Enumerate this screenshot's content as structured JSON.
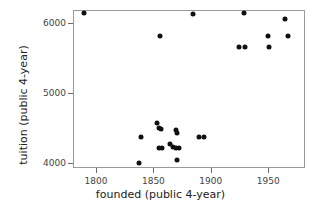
{
  "chart_data": {
    "type": "scatter",
    "title": "",
    "xlabel": "founded (public 4-year)",
    "ylabel": "tuition (public 4-year)",
    "xlim": [
      1780,
      1982
    ],
    "ylim": [
      3930,
      6180
    ],
    "xticks": [
      1800,
      1850,
      1900,
      1950
    ],
    "xticklabels": [
      "1800",
      "1850",
      "1900",
      "1950"
    ],
    "yticks": [
      4000,
      5000,
      6000
    ],
    "yticklabels": [
      "4000",
      "5000",
      "6000"
    ],
    "grid": false,
    "legend": null,
    "marker_color": "#111111",
    "axis_color": "#9a9a9a",
    "points": [
      {
        "x": 1789,
        "y": 6150
      },
      {
        "x": 1855,
        "y": 5830
      },
      {
        "x": 1884,
        "y": 6140
      },
      {
        "x": 1928,
        "y": 6150
      },
      {
        "x": 1964,
        "y": 6060
      },
      {
        "x": 1949,
        "y": 5830
      },
      {
        "x": 1966,
        "y": 5830
      },
      {
        "x": 1924,
        "y": 5670
      },
      {
        "x": 1929,
        "y": 5670
      },
      {
        "x": 1950,
        "y": 5670
      },
      {
        "x": 1838,
        "y": 4380
      },
      {
        "x": 1837,
        "y": 4010
      },
      {
        "x": 1852,
        "y": 4590
      },
      {
        "x": 1854,
        "y": 4510
      },
      {
        "x": 1856,
        "y": 4500
      },
      {
        "x": 1854,
        "y": 4230
      },
      {
        "x": 1857,
        "y": 4230
      },
      {
        "x": 1864,
        "y": 4290
      },
      {
        "x": 1866,
        "y": 4250
      },
      {
        "x": 1869,
        "y": 4480
      },
      {
        "x": 1870,
        "y": 4440
      },
      {
        "x": 1869,
        "y": 4230
      },
      {
        "x": 1871,
        "y": 4230
      },
      {
        "x": 1870,
        "y": 4060
      },
      {
        "x": 1889,
        "y": 4380
      },
      {
        "x": 1893,
        "y": 4380
      }
    ]
  }
}
